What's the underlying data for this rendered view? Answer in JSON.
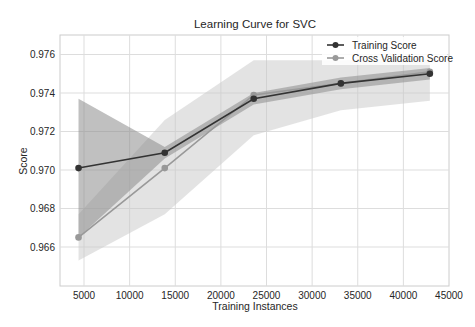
{
  "chart_data": {
    "type": "line",
    "title": "Learning Curve for SVC",
    "xlabel": "Training Instances",
    "ylabel": "Score",
    "xlim": [
      2500,
      45000
    ],
    "ylim": [
      0.9643,
      0.9771
    ],
    "xticks": [
      5000,
      10000,
      15000,
      20000,
      25000,
      30000,
      35000,
      40000,
      45000
    ],
    "xtick_labels": [
      "5000",
      "10000",
      "15000",
      "20000",
      "25000",
      "30000",
      "35000",
      "40000",
      "45000"
    ],
    "yticks": [
      0.966,
      0.968,
      0.97,
      0.972,
      0.974,
      0.976
    ],
    "ytick_labels": [
      "0.966",
      "0.968",
      "0.970",
      "0.972",
      "0.974",
      "0.976"
    ],
    "grid": true,
    "legend_position": "upper right",
    "x": [
      4400,
      13850,
      23600,
      33150,
      42900
    ],
    "series": [
      {
        "name": "Training Score",
        "color": "#333333",
        "band_color": "#8c8c8c",
        "values": [
          0.9701,
          0.9709,
          0.9737,
          0.9745,
          0.975
        ],
        "band_upper": [
          0.9737,
          0.9712,
          0.974,
          0.9748,
          0.9753
        ],
        "band_lower": [
          0.9665,
          0.9706,
          0.9734,
          0.9742,
          0.9747
        ]
      },
      {
        "name": "Cross Validation Score",
        "color": "#999999",
        "band_color": "#c8c8c8",
        "values": [
          0.9665,
          0.9701,
          0.9739,
          0.9745,
          0.9751
        ],
        "band_upper": [
          0.9677,
          0.9726,
          0.9757,
          0.9757,
          0.9758
        ],
        "band_lower": [
          0.9653,
          0.9677,
          0.9718,
          0.9731,
          0.9736
        ]
      }
    ]
  }
}
